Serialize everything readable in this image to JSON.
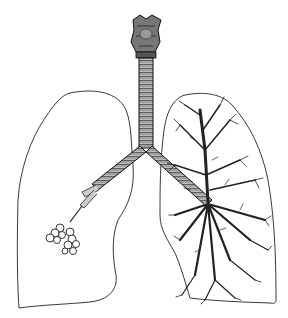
{
  "image": {
    "subject": "lungs-anatomical-illustration",
    "style": "engraving",
    "colors": {
      "ink": "#1a1a1a",
      "background": "#ffffff",
      "shade": "#555555"
    }
  }
}
